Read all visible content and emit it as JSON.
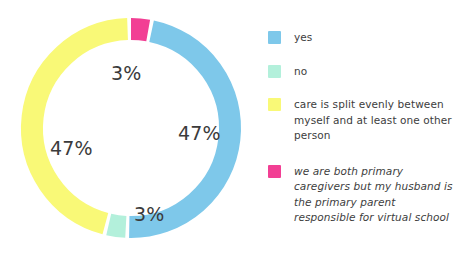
{
  "chart_data": {
    "type": "pie",
    "variant": "donut",
    "title": "",
    "xlabel": "",
    "ylabel": "",
    "legend_position": "right",
    "grid": false,
    "units": "percent",
    "categories": [
      "yes",
      "no",
      "care is split evenly between myself and at least one other person",
      "we are both primary caregivers but my husband is the primary parent responsible for virtual school"
    ],
    "values": [
      47,
      3,
      47,
      3
    ],
    "value_labels": [
      "47%",
      "3%",
      "47%",
      "3%"
    ],
    "colors": [
      "#7ec8ea",
      "#b3f0db",
      "#f9f977",
      "#f23f94"
    ],
    "slices": [
      {
        "name": "yes",
        "value": 47,
        "label": "47%",
        "color": "#7ec8ea",
        "start_angle": 12,
        "end_angle": 181
      },
      {
        "name": "no",
        "value": 3,
        "label": "3%",
        "color": "#b3f0db",
        "start_angle": 183,
        "end_angle": 193
      },
      {
        "name": "care is split evenly between myself and at least one other person",
        "value": 47,
        "label": "47%",
        "color": "#f9f977",
        "start_angle": 195,
        "end_angle": 358
      },
      {
        "name": "we are both primary caregivers but my husband is the primary parent responsible for virtual school",
        "value": 3,
        "label": "3%",
        "color": "#f23f94",
        "start_angle": 0,
        "end_angle": 10
      }
    ]
  },
  "labels": {
    "pink": "3%",
    "blue": "47%",
    "yellow": "47%",
    "mint": "3%"
  },
  "legend": {
    "items": [
      {
        "label": "yes",
        "color": "#7ec8ea",
        "style": "normal"
      },
      {
        "label": "no",
        "color": "#b3f0db",
        "style": "normal"
      },
      {
        "label": "care is split evenly between myself and at least one other person",
        "color": "#f9f977",
        "style": "normal"
      },
      {
        "label": "we are both primary caregivers but my husband is the primary parent responsible for virtual school",
        "color": "#f23f94",
        "style": "italic"
      }
    ]
  }
}
